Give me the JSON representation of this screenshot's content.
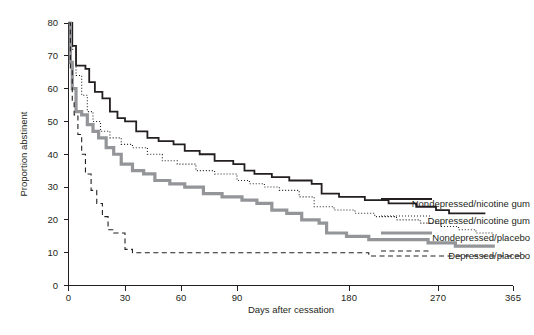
{
  "chart_data": {
    "type": "line",
    "title": "",
    "xlabel": "Days after cessation",
    "ylabel": "Proportion abstinent",
    "xlim": [
      0,
      420
    ],
    "ylim": [
      0,
      80
    ],
    "xticks": [
      0,
      30,
      60,
      90,
      180,
      270,
      365
    ],
    "xtick_labels": [
      "0",
      "30",
      "60",
      "90",
      "180",
      "270",
      "365"
    ],
    "yticks": [
      0,
      10,
      20,
      30,
      40,
      50,
      60,
      70,
      80
    ],
    "ytick_labels": [
      "0",
      "10",
      "20",
      "30",
      "40",
      "50",
      "60",
      "70",
      "80"
    ],
    "grid": false,
    "legend_position": "right-inline",
    "series": [
      {
        "name": "Nondepressed/nicotine gum",
        "style": "solid",
        "color": "#231f20",
        "width": 1.8,
        "end_value": 23,
        "points": [
          [
            0,
            80
          ],
          [
            2,
            80
          ],
          [
            2,
            73
          ],
          [
            4,
            73
          ],
          [
            4,
            67
          ],
          [
            9,
            67
          ],
          [
            9,
            66
          ],
          [
            11,
            66
          ],
          [
            11,
            62
          ],
          [
            14,
            62
          ],
          [
            14,
            59
          ],
          [
            18,
            59
          ],
          [
            18,
            57
          ],
          [
            22,
            57
          ],
          [
            22,
            53
          ],
          [
            26,
            53
          ],
          [
            26,
            51
          ],
          [
            30,
            51
          ],
          [
            30,
            50
          ],
          [
            36,
            50
          ],
          [
            36,
            47
          ],
          [
            42,
            47
          ],
          [
            42,
            45
          ],
          [
            48,
            45
          ],
          [
            48,
            44
          ],
          [
            56,
            44
          ],
          [
            56,
            43
          ],
          [
            62,
            43
          ],
          [
            62,
            41
          ],
          [
            70,
            41
          ],
          [
            70,
            40
          ],
          [
            78,
            40
          ],
          [
            78,
            38
          ],
          [
            88,
            38
          ],
          [
            88,
            37
          ],
          [
            96,
            37
          ],
          [
            96,
            35
          ],
          [
            104,
            35
          ],
          [
            104,
            34
          ],
          [
            118,
            34
          ],
          [
            118,
            33
          ],
          [
            132,
            33
          ],
          [
            132,
            32
          ],
          [
            150,
            32
          ],
          [
            150,
            31
          ],
          [
            158,
            31
          ],
          [
            158,
            28
          ],
          [
            172,
            28
          ],
          [
            172,
            27
          ],
          [
            196,
            27
          ],
          [
            196,
            26
          ],
          [
            220,
            26
          ],
          [
            220,
            25
          ],
          [
            248,
            25
          ],
          [
            248,
            24
          ],
          [
            268,
            24
          ],
          [
            268,
            23
          ],
          [
            284,
            23
          ],
          [
            284,
            22
          ],
          [
            310,
            22
          ],
          [
            310,
            22
          ],
          [
            330,
            22
          ]
        ]
      },
      {
        "name": "Depressed/nicotine gum",
        "style": "dotted",
        "color": "#231f20",
        "width": 1.1,
        "end_value": 16,
        "points": [
          [
            0,
            80
          ],
          [
            2,
            80
          ],
          [
            2,
            72
          ],
          [
            4,
            72
          ],
          [
            4,
            64
          ],
          [
            7,
            64
          ],
          [
            7,
            58
          ],
          [
            10,
            58
          ],
          [
            10,
            53
          ],
          [
            13,
            53
          ],
          [
            13,
            50
          ],
          [
            17,
            50
          ],
          [
            17,
            47
          ],
          [
            22,
            47
          ],
          [
            22,
            45
          ],
          [
            28,
            45
          ],
          [
            28,
            43
          ],
          [
            34,
            43
          ],
          [
            34,
            42
          ],
          [
            42,
            42
          ],
          [
            42,
            40
          ],
          [
            50,
            40
          ],
          [
            50,
            38
          ],
          [
            58,
            38
          ],
          [
            58,
            37
          ],
          [
            68,
            37
          ],
          [
            68,
            35
          ],
          [
            78,
            35
          ],
          [
            78,
            34
          ],
          [
            90,
            34
          ],
          [
            90,
            32
          ],
          [
            100,
            32
          ],
          [
            100,
            31
          ],
          [
            112,
            31
          ],
          [
            112,
            30
          ],
          [
            124,
            30
          ],
          [
            124,
            29
          ],
          [
            140,
            29
          ],
          [
            140,
            27
          ],
          [
            152,
            27
          ],
          [
            152,
            24
          ],
          [
            168,
            24
          ],
          [
            168,
            23
          ],
          [
            186,
            23
          ],
          [
            186,
            22
          ],
          [
            206,
            22
          ],
          [
            206,
            21
          ],
          [
            228,
            21
          ],
          [
            228,
            20
          ],
          [
            252,
            20
          ],
          [
            252,
            19
          ],
          [
            274,
            19
          ],
          [
            274,
            18
          ],
          [
            296,
            18
          ],
          [
            296,
            17
          ],
          [
            318,
            17
          ],
          [
            318,
            16
          ],
          [
            340,
            16
          ]
        ]
      },
      {
        "name": "Nondepressed/placebo",
        "style": "solid",
        "color": "#939598",
        "width": 3.2,
        "end_value": 12,
        "points": [
          [
            0,
            80
          ],
          [
            1,
            80
          ],
          [
            1,
            68
          ],
          [
            2,
            68
          ],
          [
            2,
            60
          ],
          [
            4,
            60
          ],
          [
            4,
            53
          ],
          [
            7,
            53
          ],
          [
            7,
            52
          ],
          [
            10,
            52
          ],
          [
            10,
            49
          ],
          [
            13,
            49
          ],
          [
            13,
            47
          ],
          [
            16,
            47
          ],
          [
            16,
            45
          ],
          [
            20,
            45
          ],
          [
            20,
            42
          ],
          [
            24,
            42
          ],
          [
            24,
            40
          ],
          [
            28,
            40
          ],
          [
            28,
            37
          ],
          [
            34,
            37
          ],
          [
            34,
            35
          ],
          [
            40,
            35
          ],
          [
            40,
            34
          ],
          [
            46,
            34
          ],
          [
            46,
            32
          ],
          [
            54,
            32
          ],
          [
            54,
            31
          ],
          [
            62,
            31
          ],
          [
            62,
            30
          ],
          [
            72,
            30
          ],
          [
            72,
            28
          ],
          [
            82,
            28
          ],
          [
            82,
            27
          ],
          [
            94,
            27
          ],
          [
            94,
            26
          ],
          [
            106,
            26
          ],
          [
            106,
            25
          ],
          [
            118,
            25
          ],
          [
            118,
            23
          ],
          [
            130,
            23
          ],
          [
            130,
            22
          ],
          [
            142,
            22
          ],
          [
            142,
            20
          ],
          [
            156,
            20
          ],
          [
            156,
            19
          ],
          [
            162,
            19
          ],
          [
            162,
            16
          ],
          [
            178,
            16
          ],
          [
            178,
            15
          ],
          [
            200,
            15
          ],
          [
            200,
            14
          ],
          [
            228,
            14
          ],
          [
            228,
            14
          ],
          [
            260,
            14
          ],
          [
            260,
            13
          ],
          [
            292,
            13
          ],
          [
            292,
            12
          ],
          [
            324,
            12
          ],
          [
            324,
            12
          ],
          [
            342,
            12
          ]
        ]
      },
      {
        "name": "Depressed/placebo",
        "style": "dashed",
        "color": "#231f20",
        "width": 1.1,
        "end_value": 9,
        "points": [
          [
            0,
            80
          ],
          [
            1,
            80
          ],
          [
            1,
            66
          ],
          [
            2,
            66
          ],
          [
            2,
            56
          ],
          [
            3,
            56
          ],
          [
            3,
            52
          ],
          [
            5,
            52
          ],
          [
            5,
            46
          ],
          [
            7,
            46
          ],
          [
            7,
            40
          ],
          [
            9,
            40
          ],
          [
            9,
            34
          ],
          [
            12,
            34
          ],
          [
            12,
            29
          ],
          [
            15,
            29
          ],
          [
            15,
            25
          ],
          [
            18,
            25
          ],
          [
            18,
            21
          ],
          [
            21,
            21
          ],
          [
            21,
            17
          ],
          [
            24,
            17
          ],
          [
            24,
            16
          ],
          [
            30,
            16
          ],
          [
            30,
            11
          ],
          [
            34,
            11
          ],
          [
            34,
            10
          ],
          [
            60,
            10
          ],
          [
            60,
            10
          ],
          [
            120,
            10
          ],
          [
            120,
            10
          ],
          [
            200,
            10
          ],
          [
            200,
            9
          ],
          [
            260,
            9
          ],
          [
            260,
            9
          ],
          [
            330,
            9
          ],
          [
            330,
            9
          ],
          [
            380,
            9
          ]
        ]
      }
    ],
    "annotations": [
      {
        "text": "Nondepressed/nicotine gum",
        "series": "Nondepressed/nicotine gum",
        "anchor_value": 23
      },
      {
        "text": "Depressed/nicotine gum",
        "series": "Depressed/nicotine gum",
        "anchor_value": 16
      },
      {
        "text": "Nondepressed/placebo",
        "series": "Nondepressed/placebo",
        "anchor_value": 12
      },
      {
        "text": "Depressed/placebo",
        "series": "Depressed/placebo",
        "anchor_value": 9
      }
    ]
  },
  "labels": {
    "x_axis_title": "Days after cessation",
    "y_axis_title": "Proportion abstinent",
    "series_1": "Nondepressed/nicotine gum",
    "series_2": "Depressed/nicotine gum",
    "series_3": "Nondepressed/placebo",
    "series_4": "Depressed/placebo"
  },
  "colors": {
    "ink": "#231f20",
    "gray_series": "#939598",
    "background": "#ffffff"
  }
}
